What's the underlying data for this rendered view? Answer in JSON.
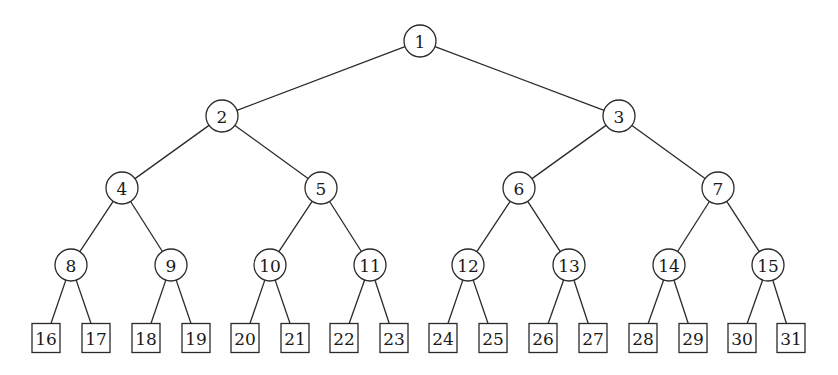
{
  "diagram": {
    "type": "complete-binary-tree",
    "internal_shape": "circle",
    "leaf_shape": "square",
    "colors": {
      "stroke": "#2a2a2a",
      "text": "#1a1a1a",
      "background": "#ffffff"
    },
    "nodes": [
      {
        "id": 1,
        "label": "1",
        "x": 420,
        "y": 41,
        "shape": "circle"
      },
      {
        "id": 2,
        "label": "2",
        "x": 222,
        "y": 116,
        "shape": "circle"
      },
      {
        "id": 3,
        "label": "3",
        "x": 619,
        "y": 116,
        "shape": "circle"
      },
      {
        "id": 4,
        "label": "4",
        "x": 122,
        "y": 188,
        "shape": "circle"
      },
      {
        "id": 5,
        "label": "5",
        "x": 321,
        "y": 188,
        "shape": "circle"
      },
      {
        "id": 6,
        "label": "6",
        "x": 519,
        "y": 188,
        "shape": "circle"
      },
      {
        "id": 7,
        "label": "7",
        "x": 718,
        "y": 188,
        "shape": "circle"
      },
      {
        "id": 8,
        "label": "8",
        "x": 71,
        "y": 265,
        "shape": "circle"
      },
      {
        "id": 9,
        "label": "9",
        "x": 171,
        "y": 265,
        "shape": "circle"
      },
      {
        "id": 10,
        "label": "10",
        "x": 270,
        "y": 265,
        "shape": "circle"
      },
      {
        "id": 11,
        "label": "11",
        "x": 370,
        "y": 265,
        "shape": "circle"
      },
      {
        "id": 12,
        "label": "12",
        "x": 468,
        "y": 265,
        "shape": "circle"
      },
      {
        "id": 13,
        "label": "13",
        "x": 569,
        "y": 265,
        "shape": "circle"
      },
      {
        "id": 14,
        "label": "14",
        "x": 669,
        "y": 265,
        "shape": "circle"
      },
      {
        "id": 15,
        "label": "15",
        "x": 768,
        "y": 265,
        "shape": "circle"
      },
      {
        "id": 16,
        "label": "16",
        "x": 46,
        "y": 338,
        "shape": "square"
      },
      {
        "id": 17,
        "label": "17",
        "x": 96,
        "y": 338,
        "shape": "square"
      },
      {
        "id": 18,
        "label": "18",
        "x": 146,
        "y": 338,
        "shape": "square"
      },
      {
        "id": 19,
        "label": "19",
        "x": 196,
        "y": 338,
        "shape": "square"
      },
      {
        "id": 20,
        "label": "20",
        "x": 245,
        "y": 338,
        "shape": "square"
      },
      {
        "id": 21,
        "label": "21",
        "x": 295,
        "y": 338,
        "shape": "square"
      },
      {
        "id": 22,
        "label": "22",
        "x": 344,
        "y": 338,
        "shape": "square"
      },
      {
        "id": 23,
        "label": "23",
        "x": 394,
        "y": 338,
        "shape": "square"
      },
      {
        "id": 24,
        "label": "24",
        "x": 443,
        "y": 338,
        "shape": "square"
      },
      {
        "id": 25,
        "label": "25",
        "x": 493,
        "y": 338,
        "shape": "square"
      },
      {
        "id": 26,
        "label": "26",
        "x": 543,
        "y": 338,
        "shape": "square"
      },
      {
        "id": 27,
        "label": "27",
        "x": 593,
        "y": 338,
        "shape": "square"
      },
      {
        "id": 28,
        "label": "28",
        "x": 643,
        "y": 338,
        "shape": "square"
      },
      {
        "id": 29,
        "label": "29",
        "x": 693,
        "y": 338,
        "shape": "square"
      },
      {
        "id": 30,
        "label": "30",
        "x": 742,
        "y": 338,
        "shape": "square"
      },
      {
        "id": 31,
        "label": "31",
        "x": 791,
        "y": 338,
        "shape": "square"
      }
    ],
    "edges": [
      [
        1,
        2
      ],
      [
        1,
        3
      ],
      [
        2,
        4
      ],
      [
        2,
        5
      ],
      [
        3,
        6
      ],
      [
        3,
        7
      ],
      [
        4,
        8
      ],
      [
        4,
        9
      ],
      [
        5,
        10
      ],
      [
        5,
        11
      ],
      [
        6,
        12
      ],
      [
        6,
        13
      ],
      [
        7,
        14
      ],
      [
        7,
        15
      ],
      [
        8,
        16
      ],
      [
        8,
        17
      ],
      [
        9,
        18
      ],
      [
        9,
        19
      ],
      [
        10,
        20
      ],
      [
        10,
        21
      ],
      [
        11,
        22
      ],
      [
        11,
        23
      ],
      [
        12,
        24
      ],
      [
        12,
        25
      ],
      [
        13,
        26
      ],
      [
        13,
        27
      ],
      [
        14,
        28
      ],
      [
        14,
        29
      ],
      [
        15,
        30
      ],
      [
        15,
        31
      ]
    ],
    "circle_radius": 16,
    "box_size": {
      "w": 28,
      "h": 29
    }
  }
}
